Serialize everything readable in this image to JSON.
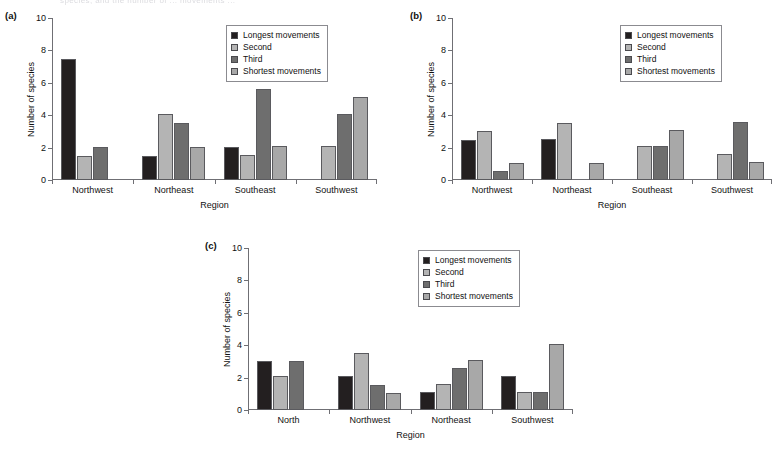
{
  "figure": {
    "top_text": "species, and the number of ... movements ...",
    "series_colors": {
      "longest": "#231f20",
      "second": "#b4b4b4",
      "third": "#6e6e6e",
      "shortest": "#a8a8a8"
    },
    "legend_labels": [
      "Longest movements",
      "Second",
      "Third",
      "Shortest movements"
    ],
    "axis": {
      "ylabel": "Number of species",
      "xlabel": "Region",
      "yticks": [
        "0",
        "2",
        "4",
        "6",
        "8",
        "10"
      ],
      "ymin": 0,
      "ymax": 10
    }
  },
  "chart_data": [
    {
      "panel": "(a)",
      "type": "bar",
      "title": "",
      "xlabel": "Region",
      "ylabel": "Number of species",
      "ylim": [
        0,
        10
      ],
      "yticks": [
        0,
        2,
        4,
        6,
        8,
        10
      ],
      "grid": false,
      "legend_position": "top-right",
      "categories": [
        "Northwest",
        "Northeast",
        "Southeast",
        "Southwest"
      ],
      "series": [
        {
          "name": "Longest movements",
          "values": [
            7.5,
            1.5,
            2.05,
            0
          ]
        },
        {
          "name": "Second",
          "values": [
            1.5,
            4.05,
            1.55,
            2.1
          ]
        },
        {
          "name": "Third",
          "values": [
            2.05,
            3.55,
            5.6,
            4.1
          ]
        },
        {
          "name": "Shortest movements",
          "values": [
            0,
            2.05,
            2.1,
            5.1
          ]
        }
      ]
    },
    {
      "panel": "(b)",
      "type": "bar",
      "title": "",
      "xlabel": "Region",
      "ylabel": "Number of species",
      "ylim": [
        0,
        10
      ],
      "yticks": [
        0,
        2,
        4,
        6,
        8,
        10
      ],
      "grid": false,
      "legend_position": "top-right",
      "categories": [
        "Northwest",
        "Northeast",
        "Southeast",
        "Southwest"
      ],
      "series": [
        {
          "name": "Longest movements",
          "values": [
            2.5,
            2.55,
            0,
            0
          ]
        },
        {
          "name": "Second",
          "values": [
            3.05,
            3.55,
            2.1,
            1.6
          ]
        },
        {
          "name": "Third",
          "values": [
            0.55,
            0,
            2.1,
            3.6
          ]
        },
        {
          "name": "Shortest movements",
          "values": [
            1.05,
            1.05,
            3.1,
            1.1
          ]
        }
      ]
    },
    {
      "panel": "(c)",
      "type": "bar",
      "title": "",
      "xlabel": "Region",
      "ylabel": "Number of species",
      "ylim": [
        0,
        10
      ],
      "yticks": [
        0,
        2,
        4,
        6,
        8,
        10
      ],
      "grid": false,
      "legend_position": "top-right",
      "categories": [
        "North",
        "Northwest",
        "Northeast",
        "Southwest"
      ],
      "series": [
        {
          "name": "Longest movements",
          "values": [
            3.0,
            2.1,
            1.1,
            2.1
          ]
        },
        {
          "name": "Second",
          "values": [
            2.1,
            3.55,
            1.6,
            1.1
          ]
        },
        {
          "name": "Third",
          "values": [
            3.05,
            1.55,
            2.6,
            1.1
          ]
        },
        {
          "name": "Shortest movements",
          "values": [
            0,
            1.05,
            3.1,
            4.1
          ]
        }
      ]
    }
  ]
}
